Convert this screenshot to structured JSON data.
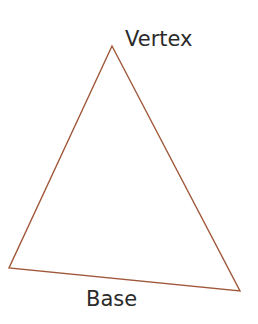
{
  "diagram": {
    "stroke_color": "#a0583a",
    "text_color": "#2a2a2a",
    "vertices": {
      "top": [
        112,
        46
      ],
      "bottom_left": [
        9,
        268
      ],
      "bottom_right": [
        240,
        291
      ]
    },
    "labels": {
      "vertex": "Vertex",
      "base": "Base"
    }
  }
}
